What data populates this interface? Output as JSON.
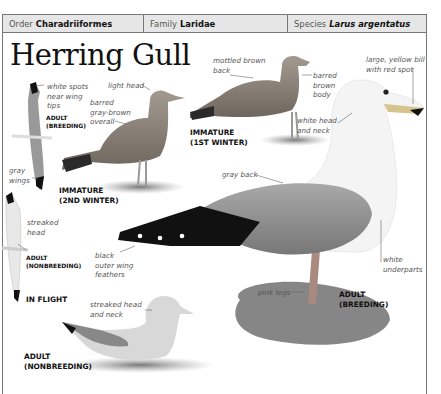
{
  "header": {
    "order_label": "Order",
    "order_value": "Charadriiformes",
    "family_label": "Family",
    "family_value": "Laridae",
    "species_label": "Species",
    "species_value": "Larus argentatus"
  },
  "title": "Herring Gull",
  "annotations": {
    "white_spots": [
      "white spots",
      "near wing",
      "tips"
    ],
    "gray_wings": [
      "gray",
      "wings"
    ],
    "streaked_head": [
      "streaked",
      "head"
    ],
    "light_head": "light head",
    "barred_gray_brown": [
      "barred",
      "gray-brown",
      "overall"
    ],
    "mottled_brown_back": [
      "mottled brown",
      "back"
    ],
    "barred_brown_body": [
      "barred",
      "brown",
      "body"
    ],
    "large_yellow_bill": [
      "large, yellow bill",
      "with red spot"
    ],
    "white_head_neck": [
      "white head",
      "and neck"
    ],
    "gray_back": "gray back",
    "black_outer_wing": [
      "black",
      "outer wing",
      "feathers"
    ],
    "white_underparts": [
      "white",
      "underparts"
    ],
    "pink_legs": "pink legs",
    "streaked_head_neck": [
      "streaked head",
      "and neck"
    ]
  },
  "captions": {
    "adult_breeding_flight": [
      "ADULT",
      "(BREEDING)"
    ],
    "adult_nonbreeding_flight": [
      "ADULT",
      "(NONBREEDING)"
    ],
    "in_flight": "IN FLIGHT",
    "immature_2nd": [
      "IMMATURE",
      "(2ND WINTER)"
    ],
    "immature_1st": [
      "IMMATURE",
      "(1ST WINTER)"
    ],
    "adult_breeding": [
      "ADULT",
      "(BREEDING)"
    ],
    "adult_nonbreeding": [
      "ADULT",
      "(NONBREEDING)"
    ]
  },
  "colors": {
    "header_bg": "#e6e6e6",
    "frame": "#777777",
    "gull_gray": "#8a8a8a",
    "wingtip_black": "#111111"
  }
}
